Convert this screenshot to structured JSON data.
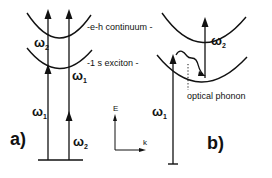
{
  "figure": {
    "panel_a": {
      "label": "a)",
      "bands": {
        "upper": "-e-h continuum -",
        "lower": "-1 s   exciton -"
      },
      "omega_labels": [
        {
          "symbol": "ω",
          "sub": "2"
        },
        {
          "symbol": "ω",
          "sub": "1"
        },
        {
          "symbol": "ω",
          "sub": "1"
        },
        {
          "symbol": "ω",
          "sub": "2"
        }
      ]
    },
    "panel_b": {
      "label": "b)",
      "phonon_label": "optical phonon",
      "omega_labels": [
        {
          "symbol": "ω",
          "sub": "2"
        },
        {
          "symbol": "ω",
          "sub": "1"
        }
      ]
    },
    "axes": {
      "y_label": "E",
      "x_label": "k"
    },
    "colors": {
      "ink": "#111111",
      "background": "#ffffff"
    }
  }
}
